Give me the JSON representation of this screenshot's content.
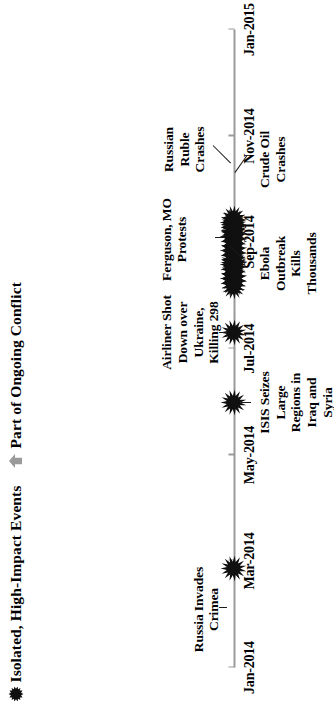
{
  "legend": {
    "items": [
      {
        "icon": "starburst-icon",
        "label": "Isolated, High-Impact Events",
        "color": "#101010"
      },
      {
        "icon": "up-arrow-icon",
        "label": "Part of Ongoing Conflict",
        "color": "#9a9a9a"
      }
    ]
  },
  "chart_data": {
    "type": "timeline",
    "title": "",
    "xlabel": "",
    "ylabel": "",
    "grid": false,
    "legend_position": "top-left",
    "axis": {
      "color": "#9a9a9a",
      "range": [
        "Jan-2014",
        "Jan-2015"
      ],
      "ticks": [
        "Jan-2014",
        "Mar-2014",
        "May-2014",
        "Jul-2014",
        "Sep-2014",
        "Nov-2014",
        "Jan-2015"
      ],
      "tick_positions_pct": [
        0,
        16.7,
        33.3,
        50,
        66.7,
        83.3,
        100
      ]
    },
    "events": [
      {
        "label": "Russia Invades\nCrimea",
        "date": "Mar-2014",
        "x_pct": 15.5,
        "side": "above",
        "marker": "starburst",
        "marker_size": "md",
        "leader": true
      },
      {
        "label": "ISIS Seizes\nLarge\nRegions in\nIraq and\nSyria",
        "date": "Jun-2014",
        "x_pct": 41.5,
        "side": "below",
        "marker": "starburst",
        "marker_size": "md",
        "leader": true
      },
      {
        "label": "Airliner Shot\nDown over\nUkraine,\nKilling 298",
        "date": "Jul-2014",
        "x_pct": 52.5,
        "side": "above",
        "marker": "starburst",
        "marker_size": "md",
        "leader": true
      },
      {
        "label": "Ebola\nOutbreak\nKills\nThousands",
        "date": "Aug-2014",
        "x_pct": 61.0,
        "side": "below",
        "marker": "starburst",
        "marker_size": "md",
        "leader": true
      },
      {
        "label": "Ferguson, MO\nProtests",
        "date": "Aug-2014",
        "x_pct": 63.5,
        "side": "above",
        "marker": "starburst",
        "marker_size": "md",
        "leader": true
      },
      {
        "label": "Russian\nRuble\nCrashes",
        "date": "Sep-2014",
        "x_pct": 68.5,
        "side": "above",
        "marker": "starburst",
        "marker_size": "md",
        "leader": true
      },
      {
        "label": "Crude Oil\nCrashes",
        "date": "Sep-2014",
        "x_pct": 69.5,
        "side": "below",
        "marker": "starburst",
        "marker_size": "md",
        "leader": true
      }
    ],
    "conflict_cluster": {
      "description": "Dense overlapping starburst cluster representing ongoing conflict events",
      "x_start_pct": 59.5,
      "x_end_pct": 70.5,
      "count": 16
    }
  }
}
